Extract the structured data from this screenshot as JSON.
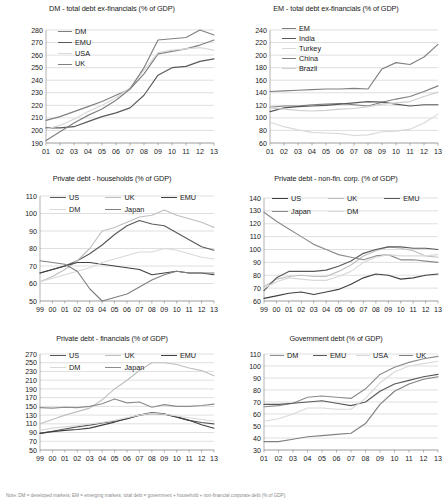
{
  "figure": {
    "footnote": "Note: DM = developed markets; EM = emerging markets; total debt = government + household + non-financial corporate debt (% of GDP).",
    "panel_count": 6
  },
  "palette": {
    "dark_gray": "#595959",
    "mid_gray": "#7f7f7f",
    "light_gray": "#bfbfbf",
    "very_light_gray": "#d9d9d9",
    "near_black": "#404040",
    "gridline": "#bfbfbf",
    "axis": "#808080",
    "background": "#ffffff"
  },
  "chart_data": [
    {
      "id": "dm-total-debt",
      "type": "line",
      "title": "DM - total debt ex-financials (% of GDP)",
      "xlabel": "",
      "ylabel": "",
      "categories": [
        "01",
        "02",
        "03",
        "04",
        "05",
        "06",
        "07",
        "08",
        "09",
        "10",
        "11",
        "12",
        "13"
      ],
      "ylim": [
        190,
        280
      ],
      "yticks": [
        190,
        200,
        210,
        220,
        230,
        240,
        250,
        260,
        270,
        280
      ],
      "grid": true,
      "legend_position": "top-left",
      "series": [
        {
          "name": "DM",
          "color": "#7f7f7f",
          "values": [
            208,
            211,
            215,
            219,
            223,
            228,
            233,
            245,
            261,
            263,
            265,
            268,
            272
          ]
        },
        {
          "name": "EMU",
          "color": "#595959",
          "values": [
            202,
            202,
            203,
            207,
            211,
            214,
            218,
            228,
            244,
            250,
            251,
            255,
            257
          ]
        },
        {
          "name": "USA",
          "color": "#d9d9d9",
          "values": [
            201,
            204,
            209,
            215,
            220,
            226,
            234,
            248,
            262,
            264,
            265,
            266,
            264
          ]
        },
        {
          "name": "UK",
          "color": "#808080",
          "values": [
            192,
            199,
            206,
            212,
            217,
            224,
            233,
            250,
            272,
            273,
            274,
            280,
            276
          ]
        }
      ]
    },
    {
      "id": "em-total-debt",
      "type": "line",
      "title": "EM - total debt ex-financials (% of GDP)",
      "xlabel": "",
      "ylabel": "",
      "categories": [
        "01",
        "02",
        "03",
        "04",
        "05",
        "06",
        "07",
        "08",
        "09",
        "10",
        "11",
        "12",
        "13"
      ],
      "ylim": [
        60,
        240
      ],
      "yticks": [
        60,
        80,
        100,
        120,
        140,
        160,
        180,
        200,
        220,
        240
      ],
      "grid": true,
      "legend_position": "top-left",
      "series": [
        {
          "name": "EM",
          "color": "#7f7f7f",
          "values": [
            117,
            119,
            119,
            121,
            122,
            123,
            121,
            119,
            125,
            130,
            134,
            142,
            151
          ]
        },
        {
          "name": "India",
          "color": "#595959",
          "values": [
            110,
            116,
            118,
            119,
            120,
            122,
            124,
            126,
            125,
            122,
            119,
            121,
            121
          ]
        },
        {
          "name": "Turkey",
          "color": "#d9d9d9",
          "values": [
            93,
            86,
            81,
            77,
            76,
            75,
            72,
            73,
            78,
            79,
            82,
            92,
            106
          ]
        },
        {
          "name": "China",
          "color": "#808080",
          "values": [
            142,
            143,
            144,
            145,
            146,
            146,
            147,
            146,
            178,
            188,
            185,
            197,
            217
          ]
        },
        {
          "name": "Brazil",
          "color": "#cfcfcf",
          "values": [
            116,
            114,
            112,
            111,
            112,
            114,
            115,
            118,
            122,
            124,
            126,
            134,
            141
          ]
        }
      ]
    },
    {
      "id": "private-debt-households",
      "type": "line",
      "title": "Private debt - households (% of GDP)",
      "xlabel": "",
      "ylabel": "",
      "categories": [
        "99",
        "00",
        "01",
        "02",
        "03",
        "04",
        "05",
        "06",
        "07",
        "08",
        "09",
        "10",
        "11",
        "12",
        "13"
      ],
      "ylim": [
        50,
        110
      ],
      "yticks": [
        50,
        60,
        70,
        80,
        90,
        100,
        110
      ],
      "grid": true,
      "legend_position": "top",
      "series": [
        {
          "name": "US",
          "color": "#595959",
          "values": [
            66,
            68,
            70,
            73,
            77,
            82,
            88,
            93,
            96,
            94,
            93,
            89,
            85,
            81,
            79
          ]
        },
        {
          "name": "UK",
          "color": "#bfbfbf",
          "values": [
            61,
            64,
            68,
            73,
            80,
            90,
            92,
            95,
            98,
            99,
            102,
            99,
            97,
            95,
            92
          ]
        },
        {
          "name": "EMU",
          "color": "#404040",
          "values": [
            66,
            68,
            70,
            72,
            72,
            71,
            70,
            69,
            68,
            65,
            66,
            67,
            66,
            66,
            65
          ]
        },
        {
          "name": "DM",
          "color": "#d9d9d9",
          "values": [
            61,
            63,
            65,
            67,
            69,
            72,
            74,
            76,
            78,
            78,
            80,
            79,
            77,
            75,
            74
          ]
        },
        {
          "name": "Japan",
          "color": "#808080",
          "values": [
            73,
            72,
            71,
            67,
            57,
            50,
            52,
            54,
            58,
            62,
            65,
            67,
            66,
            66,
            66
          ]
        }
      ]
    },
    {
      "id": "private-debt-nonfin-corp",
      "type": "line",
      "title": "Private debt - non-fin. corp. (% of GDP)",
      "xlabel": "",
      "ylabel": "",
      "categories": [
        "99",
        "00",
        "01",
        "02",
        "03",
        "04",
        "05",
        "06",
        "07",
        "08",
        "09",
        "10",
        "11",
        "12",
        "13"
      ],
      "ylim": [
        60,
        140
      ],
      "yticks": [
        60,
        70,
        80,
        90,
        100,
        110,
        120,
        130,
        140
      ],
      "grid": true,
      "legend_position": "top",
      "series": [
        {
          "name": "US",
          "color": "#404040",
          "values": [
            62,
            64,
            66,
            67,
            65,
            67,
            69,
            73,
            78,
            81,
            80,
            77,
            78,
            80,
            81
          ]
        },
        {
          "name": "UK",
          "color": "#bfbfbf",
          "values": [
            71,
            77,
            79,
            80,
            79,
            79,
            83,
            88,
            95,
            99,
            102,
            101,
            99,
            95,
            94
          ]
        },
        {
          "name": "EMU",
          "color": "#595959",
          "values": [
            68,
            78,
            83,
            83,
            83,
            84,
            87,
            91,
            97,
            100,
            102,
            102,
            101,
            101,
            100
          ]
        },
        {
          "name": "Japan",
          "color": "#8c8c8c",
          "values": [
            129,
            122,
            116,
            110,
            104,
            100,
            96,
            94,
            92,
            95,
            96,
            92,
            92,
            91,
            90
          ]
        },
        {
          "name": "DM",
          "color": "#d9d9d9",
          "values": [
            70,
            75,
            78,
            77,
            76,
            76,
            79,
            83,
            90,
            94,
            96,
            95,
            95,
            95,
            96
          ]
        }
      ]
    },
    {
      "id": "private-debt-financials",
      "type": "line",
      "title": "Private debt - financials (% of GDP)",
      "xlabel": "",
      "ylabel": "",
      "categories": [
        "99",
        "00",
        "01",
        "02",
        "03",
        "04",
        "05",
        "06",
        "07",
        "08",
        "09",
        "10",
        "11",
        "12",
        "13"
      ],
      "ylim": [
        50,
        270
      ],
      "yticks": [
        50,
        70,
        90,
        110,
        130,
        150,
        170,
        190,
        210,
        230,
        250,
        270
      ],
      "grid": true,
      "legend_position": "top",
      "series": [
        {
          "name": "US",
          "color": "#595959",
          "values": [
            88,
            93,
            98,
            103,
            107,
            112,
            116,
            122,
            130,
            136,
            133,
            125,
            118,
            113,
            110
          ]
        },
        {
          "name": "UK",
          "color": "#bfbfbf",
          "values": [
            110,
            120,
            130,
            138,
            146,
            165,
            190,
            210,
            232,
            250,
            250,
            246,
            238,
            232,
            220
          ]
        },
        {
          "name": "EMU",
          "color": "#404040",
          "values": [
            88,
            92,
            95,
            97,
            100,
            107,
            114,
            122,
            130,
            134,
            132,
            126,
            118,
            108,
            100
          ]
        },
        {
          "name": "DM",
          "color": "#d9d9d9",
          "values": [
            95,
            100,
            103,
            106,
            110,
            113,
            118,
            124,
            130,
            134,
            132,
            128,
            124,
            120,
            116
          ]
        },
        {
          "name": "Japan",
          "color": "#8c8c8c",
          "values": [
            147,
            146,
            148,
            147,
            150,
            156,
            167,
            158,
            160,
            148,
            154,
            150,
            150,
            152,
            155
          ]
        }
      ]
    },
    {
      "id": "government-debt",
      "type": "line",
      "title": "Government debt (% of GDP)",
      "xlabel": "",
      "ylabel": "",
      "categories": [
        "01",
        "02",
        "03",
        "04",
        "05",
        "06",
        "07",
        "08",
        "09",
        "10",
        "11",
        "12",
        "13"
      ],
      "ylim": [
        30,
        110
      ],
      "yticks": [
        30,
        40,
        50,
        60,
        70,
        80,
        90,
        100,
        110
      ],
      "grid": true,
      "legend_position": "top",
      "series": [
        {
          "name": "DM",
          "color": "#8c8c8c",
          "values": [
            66,
            67,
            69,
            74,
            75,
            74,
            73,
            81,
            93,
            99,
            103,
            106,
            108
          ]
        },
        {
          "name": "EMU",
          "color": "#595959",
          "values": [
            68,
            68,
            69,
            70,
            71,
            69,
            67,
            70,
            79,
            85,
            88,
            91,
            93
          ]
        },
        {
          "name": "USA",
          "color": "#d9d9d9",
          "values": [
            54,
            56,
            60,
            65,
            65,
            64,
            64,
            73,
            86,
            95,
            100,
            102,
            104
          ]
        },
        {
          "name": "UK",
          "color": "#808080",
          "values": [
            37,
            37,
            39,
            41,
            42,
            43,
            44,
            52,
            68,
            79,
            85,
            89,
            91
          ]
        }
      ]
    }
  ]
}
